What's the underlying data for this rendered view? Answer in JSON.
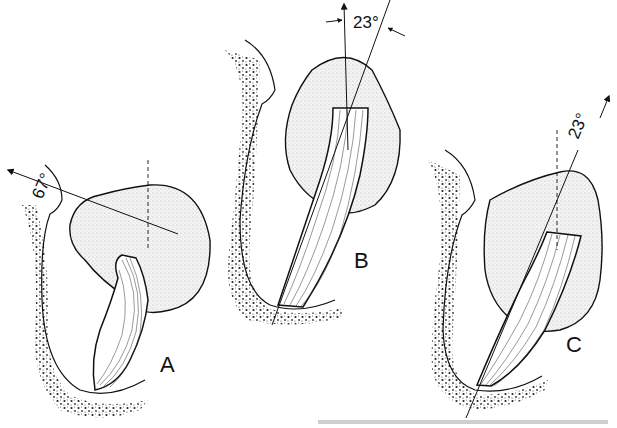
{
  "figure": {
    "panels": [
      {
        "id": "A",
        "label": "A",
        "angle_label": "67°",
        "angle_value": 67
      },
      {
        "id": "B",
        "label": "B",
        "angle_label": "23°",
        "angle_value": 23
      },
      {
        "id": "C",
        "label": "C",
        "angle_label": "23°",
        "angle_value": 23
      }
    ],
    "colors": {
      "ink": "#111111",
      "background": "#ffffff"
    }
  }
}
